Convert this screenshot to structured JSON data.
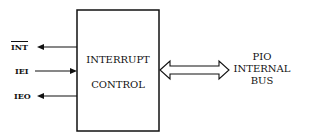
{
  "diagram": {
    "block": {
      "line1": "INTERRUPT",
      "line2": "CONTROL"
    },
    "signals": [
      {
        "label": "INT",
        "overline": true,
        "direction": "out"
      },
      {
        "label": "IEI",
        "overline": false,
        "direction": "in"
      },
      {
        "label": "IEO",
        "overline": false,
        "direction": "out"
      }
    ],
    "bus": {
      "line1": "PIO",
      "line2": "INTERNAL",
      "line3": "BUS",
      "direction": "bidirectional"
    }
  }
}
